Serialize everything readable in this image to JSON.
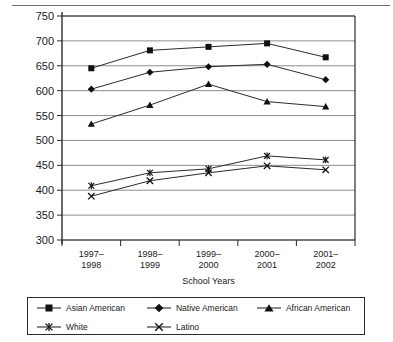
{
  "chart_data": {
    "type": "line",
    "title": "",
    "xlabel": "School Years",
    "ylabel": "",
    "categories": [
      "1997–1998",
      "1998–1999",
      "1999–2000",
      "2000–2001",
      "2001–2002"
    ],
    "ylim": [
      300,
      750
    ],
    "ytick_step": 50,
    "yticks": [
      750,
      700,
      650,
      600,
      550,
      500,
      450,
      400,
      350,
      300
    ],
    "grid": true,
    "legend_position": "below",
    "series": [
      {
        "name": "Asian American",
        "marker": "square",
        "values": [
          645,
          681,
          688,
          695,
          667
        ]
      },
      {
        "name": "Native American",
        "marker": "diamond",
        "values": [
          603,
          637,
          648,
          653,
          622
        ]
      },
      {
        "name": "African American",
        "marker": "triangle",
        "values": [
          533,
          571,
          613,
          578,
          568
        ]
      },
      {
        "name": "White",
        "marker": "asterisk",
        "values": [
          409,
          435,
          443,
          469,
          461
        ]
      },
      {
        "name": "Latino",
        "marker": "cross",
        "values": [
          388,
          419,
          435,
          449,
          441
        ]
      }
    ]
  },
  "legend": {
    "items": [
      {
        "label": "Asian American",
        "marker": "square-marker"
      },
      {
        "label": "Native American",
        "marker": "diamond-marker"
      },
      {
        "label": "African American",
        "marker": "triangle-marker"
      },
      {
        "label": "White",
        "marker": "asterisk-marker"
      },
      {
        "label": "Latino",
        "marker": "cross-marker"
      }
    ]
  },
  "colors": {
    "line": "#2b2b2b",
    "grid": "#8c8c8c",
    "axis": "#2b2b2b",
    "text": "#1a1a1a",
    "background": "#ffffff"
  }
}
